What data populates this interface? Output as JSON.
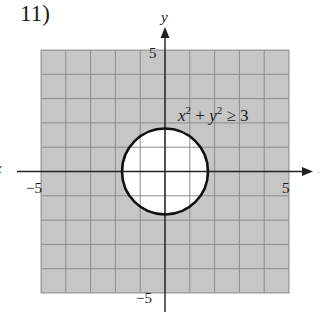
{
  "problem": {
    "number_label": "11)"
  },
  "axes": {
    "x_label": "x",
    "y_label": "y",
    "x_ticks": [
      {
        "value": -5,
        "label": "−5"
      },
      {
        "value": 5,
        "label": "5"
      }
    ],
    "y_ticks": [
      {
        "value": 5,
        "label": "5"
      },
      {
        "value": -5,
        "label": "−5"
      }
    ],
    "xlim": [
      -5,
      5
    ],
    "ylim": [
      -5,
      5
    ]
  },
  "inequality": {
    "label_x": "x",
    "label_plus": " + ",
    "label_y": "y",
    "label_sup": "2",
    "label_rel": " ≥ 3",
    "full_text": "x² + y² ≥ 3"
  },
  "colors": {
    "shade_fill": "#c6c6c6",
    "grid_line": "#8c8c8c",
    "inner_grid_line": "#a8a8a8",
    "axis": "#222222",
    "boundary": "#111111",
    "interior": "#ffffff"
  },
  "chart_data": {
    "type": "region",
    "title": "11)",
    "xlabel": "x",
    "ylabel": "y",
    "xlim": [
      -5,
      5
    ],
    "ylim": [
      -5,
      5
    ],
    "grid": true,
    "grid_step": 1,
    "x_tick_labels": [
      "−5",
      "5"
    ],
    "y_tick_labels": [
      "5",
      "−5"
    ],
    "inequality": "x^2 + y^2 >= 3",
    "boundary": {
      "shape": "circle",
      "center": [
        0,
        0
      ],
      "radius": 1.732,
      "radius_expr": "sqrt(3)",
      "line_style": "solid"
    },
    "shaded_region": "outside circle (within grid bounds)",
    "annotation": {
      "text": "x² + y² ≥ 3",
      "position": [
        3.2,
        2.5
      ]
    }
  }
}
